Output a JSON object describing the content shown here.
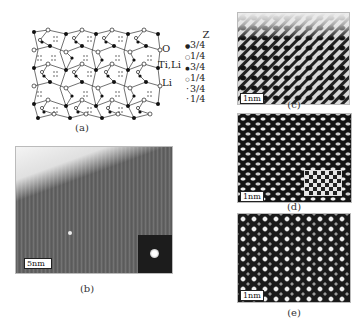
{
  "figure": {
    "panels": {
      "a": {
        "caption": "(a)",
        "site_labels": [
          "O",
          "Ti,Li",
          "Li"
        ],
        "legend": {
          "title": "Z",
          "entries": [
            {
              "marker": "filled-large",
              "value": "3/4"
            },
            {
              "marker": "open-large",
              "value": "1/4"
            },
            {
              "marker": "filled-medium",
              "value": "3/4"
            },
            {
              "marker": "open-medium",
              "value": "1/4"
            },
            {
              "marker": "dot-small",
              "value": "3/4"
            },
            {
              "marker": "dot-small",
              "value": "1/4"
            }
          ]
        }
      },
      "b": {
        "caption": "(b)",
        "scale_bar": "5nm"
      },
      "c": {
        "caption": "(c)",
        "scale_bar": "1nm"
      },
      "d": {
        "caption": "(d)",
        "scale_bar": "1nm"
      },
      "e": {
        "caption": "(e)",
        "scale_bar": "1nm"
      }
    },
    "markers": {
      "filled": "●",
      "open": "○",
      "dot": "·"
    },
    "colors": {
      "ink": "#111111",
      "paper": "#ffffff",
      "tem_dark": "#1a1a1a",
      "tem_light": "#e8e8e8"
    }
  }
}
